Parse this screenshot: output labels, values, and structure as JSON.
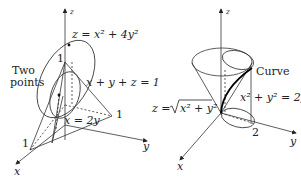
{
  "left_figure": {
    "axes": {
      "x": "x",
      "y": "y",
      "z": "z"
    },
    "surface_label": "z = x² + 4y²",
    "plane_label": "x + y + z = 1",
    "line_label": "x = 2y",
    "annotation_line1": "Two",
    "annotation_line2": "points",
    "tick_z": "1",
    "tick_x": "1",
    "tick_y": "1"
  },
  "right_figure": {
    "axes": {
      "x": "x",
      "y": "y",
      "z": "z"
    },
    "cone_label_prefix": "z =",
    "cone_label_radicand": "x² + y²",
    "cylinder_label": "x² + y² = 2y",
    "curve_label": "Curve",
    "tick_y": "2"
  },
  "colors": {
    "ink": "#222222",
    "background": "#ffffff"
  }
}
